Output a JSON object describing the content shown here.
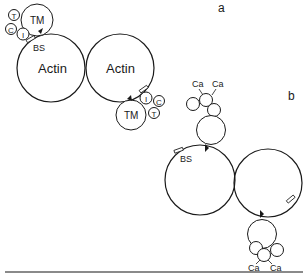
{
  "panels": {
    "a": {
      "label": "a"
    },
    "b": {
      "label": "b"
    }
  },
  "labels": {
    "actin": "Actin",
    "tm": "TM",
    "bs": "BS",
    "troponin_t": "T",
    "troponin_c": "C",
    "troponin_i": "I",
    "calcium": "Ca"
  },
  "colors": {
    "stroke": "#1a1a1a",
    "background": "#ffffff",
    "rule": "#8a8a8a"
  }
}
